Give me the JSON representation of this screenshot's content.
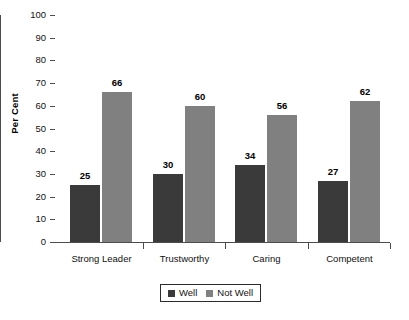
{
  "chart_data": {
    "type": "bar",
    "title": "",
    "xlabel": "",
    "ylabel": "Per Cent",
    "ylim": [
      0,
      100
    ],
    "ytick_step": 10,
    "yticks": [
      0,
      10,
      20,
      30,
      40,
      50,
      60,
      70,
      80,
      90,
      100
    ],
    "ytick_labels": [
      "0",
      "10",
      "20",
      "30",
      "40",
      "50",
      "60",
      "70",
      "80",
      "90",
      "100"
    ],
    "grid": false,
    "legend_position": "bottom-center",
    "categories": [
      "Strong Leader",
      "Trustworthy",
      "Caring",
      "Competent"
    ],
    "series": [
      {
        "name": "Well",
        "color": "#3a3a3a",
        "values": [
          25,
          30,
          34,
          27
        ],
        "value_labels": [
          "25",
          "30",
          "34",
          "27"
        ]
      },
      {
        "name": "Not Well",
        "color": "#808080",
        "values": [
          66,
          60,
          56,
          62
        ],
        "value_labels": [
          "66",
          "60",
          "56",
          "62"
        ]
      }
    ]
  },
  "axes": {
    "y_title": "Per Cent",
    "axis_color": "#4c4c4c"
  },
  "legend": {
    "items": [
      {
        "label": "Well",
        "color": "#3a3a3a"
      },
      {
        "label": "Not Well",
        "color": "#808080"
      }
    ]
  },
  "caption": {
    "text": ""
  }
}
